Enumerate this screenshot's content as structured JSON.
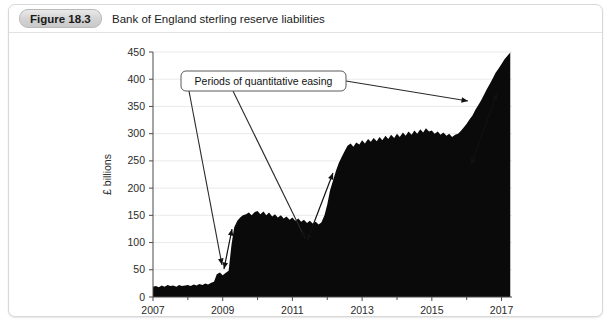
{
  "figure": {
    "badge": "Figure 18.3",
    "title": "Bank of England sterling reserve liabilities"
  },
  "annotation": {
    "label": "Periods of quantitative easing"
  },
  "chart_data": {
    "type": "area",
    "title": "Bank of England sterling reserve liabilities",
    "xlabel": "",
    "ylabel": "£ billions",
    "ylim": [
      0,
      450
    ],
    "xlim": [
      2007,
      2017.3
    ],
    "grid": true,
    "legend": false,
    "ytick_labels": [
      "0",
      "50",
      "100",
      "150",
      "200",
      "250",
      "300",
      "350",
      "400",
      "450"
    ],
    "ytick_values": [
      0,
      50,
      100,
      150,
      200,
      250,
      300,
      350,
      400,
      450
    ],
    "xtick_labels": [
      "2007",
      "2009",
      "2011",
      "2013",
      "2015",
      "2017"
    ],
    "xtick_values": [
      2007,
      2009,
      2011,
      2013,
      2015,
      2017
    ],
    "series": [
      {
        "name": "Sterling reserve liabilities",
        "color": "#0a0a0a",
        "x": [
          2007.0,
          2007.08,
          2007.17,
          2007.25,
          2007.33,
          2007.42,
          2007.5,
          2007.58,
          2007.67,
          2007.75,
          2007.83,
          2007.92,
          2008.0,
          2008.08,
          2008.17,
          2008.25,
          2008.33,
          2008.42,
          2008.5,
          2008.58,
          2008.67,
          2008.75,
          2008.83,
          2008.92,
          2009.0,
          2009.08,
          2009.17,
          2009.25,
          2009.33,
          2009.42,
          2009.5,
          2009.58,
          2009.67,
          2009.75,
          2009.83,
          2009.92,
          2010.0,
          2010.08,
          2010.17,
          2010.25,
          2010.33,
          2010.42,
          2010.5,
          2010.58,
          2010.67,
          2010.75,
          2010.83,
          2010.92,
          2011.0,
          2011.08,
          2011.17,
          2011.25,
          2011.33,
          2011.42,
          2011.5,
          2011.58,
          2011.67,
          2011.75,
          2011.83,
          2011.92,
          2012.0,
          2012.08,
          2012.17,
          2012.25,
          2012.33,
          2012.42,
          2012.5,
          2012.58,
          2012.67,
          2012.75,
          2012.83,
          2012.92,
          2013.0,
          2013.08,
          2013.17,
          2013.25,
          2013.33,
          2013.42,
          2013.5,
          2013.58,
          2013.67,
          2013.75,
          2013.83,
          2013.92,
          2014.0,
          2014.08,
          2014.17,
          2014.25,
          2014.33,
          2014.42,
          2014.5,
          2014.58,
          2014.67,
          2014.75,
          2014.83,
          2014.92,
          2015.0,
          2015.08,
          2015.17,
          2015.25,
          2015.33,
          2015.42,
          2015.5,
          2015.58,
          2015.67,
          2015.75,
          2015.83,
          2015.92,
          2016.0,
          2016.08,
          2016.17,
          2016.25,
          2016.33,
          2016.42,
          2016.5,
          2016.58,
          2016.67,
          2016.75,
          2016.83,
          2016.92,
          2017.0,
          2017.08,
          2017.17,
          2017.25
        ],
        "y": [
          19,
          20,
          18,
          21,
          19,
          22,
          20,
          21,
          19,
          22,
          20,
          21,
          22,
          20,
          23,
          21,
          24,
          22,
          25,
          23,
          26,
          28,
          42,
          45,
          40,
          44,
          48,
          95,
          128,
          140,
          146,
          150,
          152,
          155,
          150,
          156,
          158,
          152,
          157,
          150,
          155,
          148,
          152,
          146,
          150,
          144,
          148,
          142,
          146,
          140,
          144,
          138,
          142,
          136,
          140,
          135,
          138,
          133,
          137,
          150,
          170,
          196,
          215,
          232,
          246,
          258,
          268,
          278,
          282,
          276,
          284,
          280,
          288,
          282,
          290,
          285,
          292,
          286,
          294,
          288,
          296,
          290,
          298,
          292,
          300,
          294,
          302,
          296,
          304,
          298,
          306,
          300,
          308,
          302,
          310,
          304,
          306,
          300,
          304,
          298,
          302,
          296,
          300,
          294,
          298,
          300,
          305,
          312,
          318,
          326,
          334,
          344,
          352,
          362,
          372,
          382,
          392,
          402,
          412,
          420,
          428,
          436,
          443,
          449
        ]
      }
    ],
    "annotations": [
      {
        "text": "Periods of quantitative easing",
        "markers": [
          {
            "name": "qe-round-1",
            "period": "2009",
            "from": 60,
            "to": 148
          },
          {
            "name": "qe-round-2",
            "period": "2012",
            "from": 160,
            "to": 285
          },
          {
            "name": "qe-round-3",
            "period": "2016",
            "from": 320,
            "to": 445
          }
        ]
      }
    ]
  }
}
